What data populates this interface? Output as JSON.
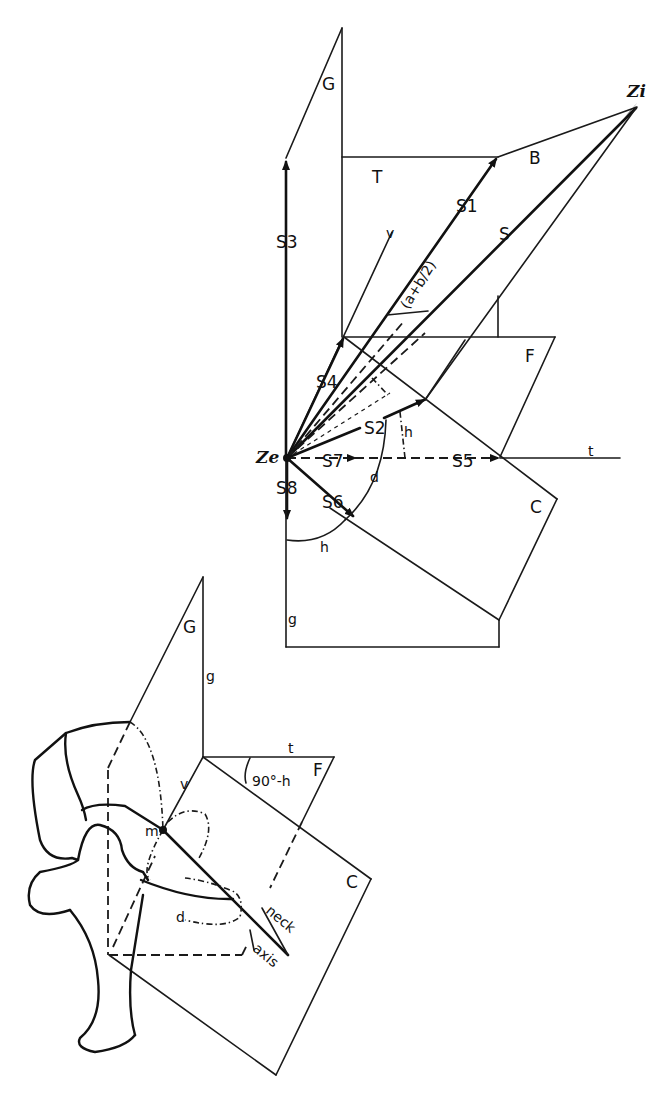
{
  "figure": {
    "type": "geometric-vector-diagram",
    "upper_diagram": {
      "planes": [
        "G",
        "T",
        "B",
        "F",
        "C"
      ],
      "points": [
        "Zi",
        "Ze"
      ],
      "vectors": [
        "S",
        "S1",
        "S2",
        "S3",
        "S4",
        "S5",
        "S6",
        "S7",
        "S8"
      ],
      "axes": [
        "v",
        "t",
        "g"
      ],
      "angles": [
        "(a+b/2)",
        "h",
        "d",
        "h"
      ],
      "labels": {
        "G": "G",
        "T": "T",
        "B": "B",
        "F": "F",
        "C": "C",
        "Zi": "Zi",
        "Ze": "Ze",
        "S": "S",
        "S1": "S1",
        "S2": "S2",
        "S3": "S3",
        "S4": "S4",
        "S5": "S5",
        "S6": "S6",
        "S7": "S7",
        "S8": "S8",
        "v": "v",
        "t": "t",
        "g": "g",
        "angle_ab": "(a+b/2)",
        "angle_h_upper": "h",
        "angle_h_lower": "h",
        "angle_d": "d"
      }
    },
    "lower_diagram": {
      "planes": [
        "G",
        "F",
        "C"
      ],
      "labels": {
        "G": "G",
        "g": "g",
        "t": "t",
        "F": "F",
        "v": "v",
        "angle": "90°-h",
        "m": "m",
        "C": "C",
        "d": "d",
        "neck": "neck",
        "axis": "axis"
      },
      "subject": "femur (hip joint) outline with neck axis"
    }
  }
}
